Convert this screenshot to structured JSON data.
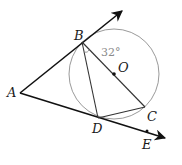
{
  "diagram": {
    "type": "geometry",
    "colors": {
      "rays": "#111111",
      "chords": "#333333",
      "circle": "#9a9a9a",
      "angle_label": "#8a8a8a"
    },
    "points": {
      "A": {
        "label": "A",
        "x": 20,
        "y": 93
      },
      "B": {
        "label": "B",
        "x": 82,
        "y": 42
      },
      "O": {
        "label": "O",
        "x": 114,
        "y": 74
      },
      "C": {
        "label": "C",
        "x": 145,
        "y": 107
      },
      "D": {
        "label": "D",
        "x": 98,
        "y": 118
      },
      "E": {
        "label": "E",
        "x": 147,
        "y": 131
      }
    },
    "circle": {
      "center": "O",
      "r": 45
    },
    "angle": {
      "at": "B",
      "between": [
        "D",
        "C"
      ],
      "label": "32°"
    }
  }
}
